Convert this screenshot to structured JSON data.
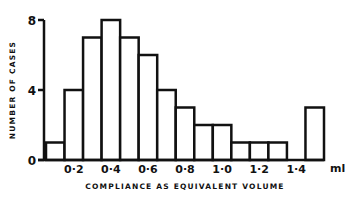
{
  "chart_data": {
    "type": "bar",
    "title": "",
    "xlabel": "COMPLIANCE AS EQUIVALENT VOLUME",
    "ylabel": "NUMBER OF CASES",
    "x_unit_label": "ml",
    "bin_centers": [
      0.1,
      0.2,
      0.3,
      0.4,
      0.5,
      0.6,
      0.7,
      0.8,
      0.9,
      1.0,
      1.1,
      1.2,
      1.3,
      1.4,
      1.5
    ],
    "values": [
      1,
      4,
      7,
      8,
      7,
      6,
      4,
      3,
      2,
      2,
      1,
      1,
      1,
      0,
      3
    ],
    "bin_width": 0.1,
    "xlim": [
      0.05,
      1.55
    ],
    "ylim": [
      0,
      8
    ],
    "x_ticks": [
      {
        "value": 0.2,
        "label": "0·2"
      },
      {
        "value": 0.4,
        "label": "0·4"
      },
      {
        "value": 0.6,
        "label": "0·6"
      },
      {
        "value": 0.8,
        "label": "0·8"
      },
      {
        "value": 1.0,
        "label": "1·0"
      },
      {
        "value": 1.2,
        "label": "1·2"
      },
      {
        "value": 1.4,
        "label": "1·4"
      }
    ],
    "y_ticks": [
      {
        "value": 0,
        "label": "0"
      },
      {
        "value": 4,
        "label": "4"
      },
      {
        "value": 8,
        "label": "8"
      }
    ],
    "grid": false,
    "legend": "none",
    "colors": {
      "ink": "#111111",
      "fill": "#ffffff"
    }
  }
}
